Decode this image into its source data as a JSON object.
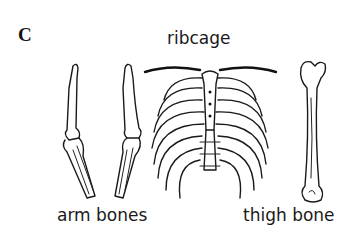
{
  "figure": {
    "panel_letter": "C",
    "items": [
      {
        "id": "arm",
        "label": "arm bones"
      },
      {
        "id": "ribcage",
        "label": "ribcage"
      },
      {
        "id": "thigh",
        "label": "thigh bone"
      }
    ]
  }
}
